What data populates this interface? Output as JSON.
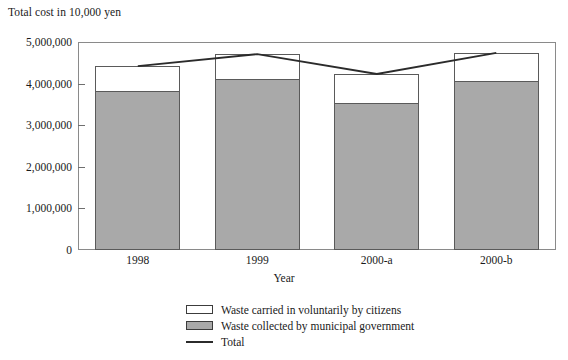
{
  "chart_data": {
    "type": "bar",
    "title": "Total cost in 10,000 yen",
    "xlabel": "Year",
    "ylabel": "Total cost in 10,000 yen",
    "categories": [
      "1998",
      "1999",
      "2000-a",
      "2000-b"
    ],
    "ylim": [
      0,
      5000000
    ],
    "yticks": [
      0,
      1000000,
      2000000,
      3000000,
      4000000,
      5000000
    ],
    "ytick_labels": [
      "0",
      "1,000,000",
      "2,000,000",
      "3,000,000",
      "4,000,000",
      "5,000,000"
    ],
    "grid": false,
    "legend_position": "bottom-center",
    "stacked": true,
    "series": [
      {
        "name": "Waste collected by municipal government",
        "type": "bar",
        "color": "#a9a9a9",
        "values": [
          3790000,
          4080000,
          3500000,
          4040000
        ]
      },
      {
        "name": "Waste carried in voluntarily by citizens",
        "type": "bar",
        "color": "#ffffff",
        "values": [
          630000,
          630000,
          730000,
          700000
        ]
      },
      {
        "name": "Total",
        "type": "line",
        "color": "#2b2b2b",
        "values": [
          4420000,
          4710000,
          4230000,
          4740000
        ]
      }
    ]
  },
  "legend": {
    "items": [
      {
        "label": "Waste carried in voluntarily by citizens",
        "marker": "hollow-swatch"
      },
      {
        "label": "Waste collected by municipal government",
        "marker": "filled-swatch"
      },
      {
        "label": "Total",
        "marker": "line"
      }
    ]
  },
  "colors": {
    "bar_fill_gray": "#a9a9a9",
    "bar_fill_white": "#ffffff",
    "bar_border": "#5a5a5a",
    "line": "#2b2b2b",
    "frame": "#8a8a8a",
    "text": "#1a1a1a"
  }
}
